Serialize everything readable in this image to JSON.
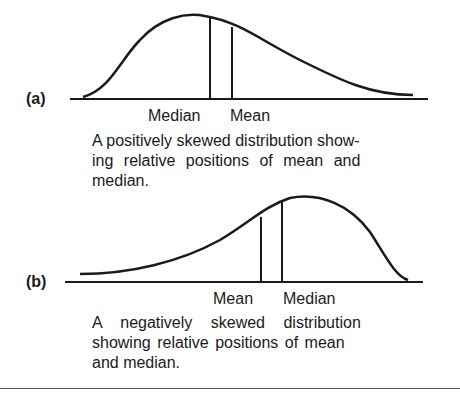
{
  "figure": {
    "panel_a": {
      "label": "(a)",
      "marker_left": "Median",
      "marker_right": "Mean",
      "caption": "A positively skewed distribution showing relative positions of mean and median.",
      "caption_lines": [
        "A positively skewed distribution show-",
        "ing relative positions of mean and",
        "median."
      ]
    },
    "panel_b": {
      "label": "(b)",
      "marker_left": "Mean",
      "marker_right": "Median",
      "caption": "A negatively skewed distribution showing relative positions of mean and median.",
      "caption_lines": [
        "A negatively skewed distribution",
        "showing relative positions of mean",
        "and median."
      ]
    }
  },
  "colors": {
    "ink": "#1a1a1a",
    "background": "#ffffff"
  }
}
